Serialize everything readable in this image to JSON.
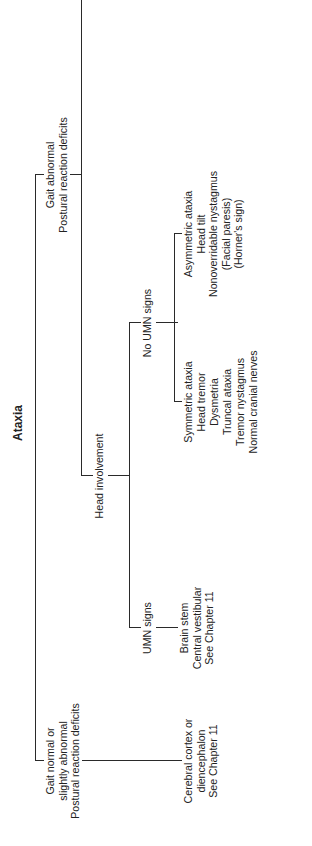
{
  "diagram": {
    "title": "Ataxia",
    "branches": {
      "gait_normal": {
        "label": [
          "Gait normal or",
          "slightly abnormal",
          "Postural reaction deficits"
        ],
        "result": [
          "Cerebral cortex or",
          "diencephalon",
          "See Chapter 11"
        ]
      },
      "gait_abnormal": {
        "label": [
          "Gait abnormal",
          "Postural reaction deficits"
        ],
        "head_involvement": {
          "label": "Head involvement",
          "umn_signs": {
            "label": "UMN signs",
            "result": [
              "Brain stem",
              "Central vestibular",
              "See Chapter 11"
            ]
          },
          "no_umn_signs": {
            "label": "No UMN signs",
            "symmetric": {
              "signs": [
                "Symmetric ataxia",
                "Head tremor",
                "Dysmetria",
                "Truncal ataxia",
                "Tremor nystagmus",
                "Normal cranial nerves"
              ],
              "result": [
                "Cerebellum",
                "See Chapter 11"
              ]
            },
            "asymmetric": {
              "signs": [
                "Asymmetric ataxia",
                "Head tilt",
                "Nonoverridable nystagmus",
                "(Facial paresis)",
                "(Horner's sign)"
              ],
              "result": [
                "Peripheral vestibular",
                "See Chapter 11"
              ]
            }
          }
        },
        "no_head_involvement": {
          "label": "No head involvement",
          "pelvic": {
            "label": [
              "Ataxia of",
              "pelvic limbs and",
              "trunk, thoracic",
              "limbs normal"
            ],
            "result": [
              "Pelvic limb paresis",
              "See Chapter 9"
            ]
          },
          "tetra": {
            "label": [
              "Ataxia of pelvic",
              "and thoracic limbs",
              "and trunk"
            ],
            "result": [
              "Tetraparesis",
              "See Chapter 10"
            ]
          }
        }
      }
    },
    "caption": {
      "figure": "Figure 4–11.",
      "text": "Localization of lesions causing ataxia."
    }
  }
}
